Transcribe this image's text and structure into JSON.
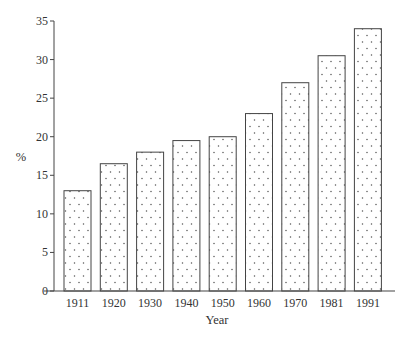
{
  "chart_data": {
    "type": "bar",
    "title": "",
    "xlabel": "Year",
    "ylabel": "%",
    "categories": [
      "1911",
      "1920",
      "1930",
      "1940",
      "1950",
      "1960",
      "1970",
      "1981",
      "1991"
    ],
    "values": [
      13.0,
      16.5,
      18.0,
      19.5,
      20.0,
      23.0,
      27.0,
      30.5,
      34.0
    ],
    "ylim": [
      0,
      35
    ],
    "yticks": [
      0,
      5,
      10,
      15,
      20,
      25,
      30,
      35
    ],
    "grid": false,
    "legend": null,
    "bar_fill": "dotted pattern",
    "colors": {
      "bar_border": "#444444",
      "dot": "#555555",
      "axis": "#444444",
      "background": "#ffffff"
    }
  }
}
